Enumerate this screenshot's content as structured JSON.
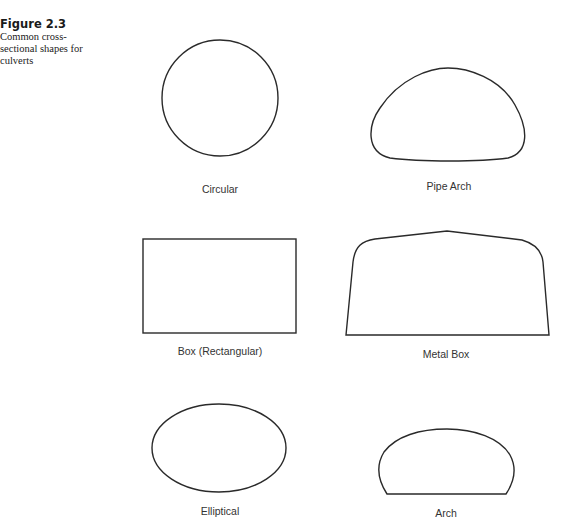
{
  "figure": {
    "number": "Figure 2.3",
    "caption_lines": [
      "Common cross-",
      "sectional shapes for",
      "culverts"
    ]
  },
  "shapes": [
    {
      "id": "circular",
      "label": "Circular"
    },
    {
      "id": "pipe-arch",
      "label": "Pipe Arch"
    },
    {
      "id": "box",
      "label": "Box (Rectangular)"
    },
    {
      "id": "metal-box",
      "label": "Metal Box"
    },
    {
      "id": "elliptical",
      "label": "Elliptical"
    },
    {
      "id": "arch",
      "label": "Arch"
    }
  ],
  "style": {
    "stroke": "#2a2a2a"
  }
}
